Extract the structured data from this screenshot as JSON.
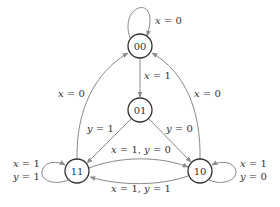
{
  "diagram": {
    "type": "state-machine",
    "nodes": [
      {
        "id": "00",
        "label": "00"
      },
      {
        "id": "01",
        "label": "01"
      },
      {
        "id": "11",
        "label": "11"
      },
      {
        "id": "10",
        "label": "10"
      }
    ],
    "edges": [
      {
        "from": "00",
        "to": "00",
        "label_var": "x",
        "label_rest": " = 0"
      },
      {
        "from": "00",
        "to": "01",
        "label_var": "x",
        "label_rest": " = 1"
      },
      {
        "from": "11",
        "to": "00",
        "label_var": "x",
        "label_rest": " = 0"
      },
      {
        "from": "10",
        "to": "00",
        "label_var": "x",
        "label_rest": " = 0"
      },
      {
        "from": "01",
        "to": "11",
        "label_var": "y",
        "label_rest": " = 1"
      },
      {
        "from": "01",
        "to": "10",
        "label_var": "y",
        "label_rest": " = 0"
      },
      {
        "from": "11",
        "to": "10",
        "label_var1": "x",
        "label_rest1": " = 1, ",
        "label_var2": "y",
        "label_rest2": " = 0"
      },
      {
        "from": "10",
        "to": "11",
        "label_var1": "x",
        "label_rest1": " = 1, ",
        "label_var2": "y",
        "label_rest2": " = 1"
      },
      {
        "from": "11",
        "to": "11",
        "line1_var": "x",
        "line1_rest": " = 1",
        "line2_var": "y",
        "line2_rest": " = 1"
      },
      {
        "from": "10",
        "to": "10",
        "line1_var": "x",
        "line1_rest": " = 1",
        "line2_var": "y",
        "line2_rest": " = 0"
      }
    ]
  }
}
